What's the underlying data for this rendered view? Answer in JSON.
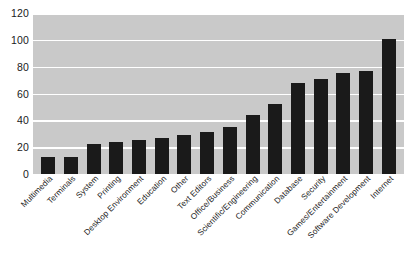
{
  "chart_data": {
    "type": "bar",
    "title": "",
    "subtitle": "",
    "xlabel": "",
    "ylabel": "",
    "ylim": [
      0,
      120
    ],
    "ytick_step": 20,
    "yticks": [
      "120",
      "100",
      "80",
      "60",
      "40",
      "20",
      "0"
    ],
    "grid": true,
    "grid_axis": "y",
    "legend": false,
    "legend_position": "none",
    "bar_color": "#1a1a1a",
    "plot_background": "#c9c9c9",
    "gridline_color": "#ffffff",
    "page_background": "#ffffff",
    "xtick_rotation": -45,
    "categories": [
      "Multimedia",
      "Terminals",
      "System",
      "Printing",
      "Desktop Environment",
      "Education",
      "Other",
      "Text Editors",
      "Office/Business",
      "Scientific/Engineering",
      "Communication",
      "Database",
      "Security",
      "Games/Entertainment",
      "Software Development",
      "Internet"
    ],
    "values": [
      13,
      13,
      22,
      24,
      25,
      27,
      29,
      31,
      35,
      44,
      52,
      68,
      71,
      75,
      77,
      101
    ]
  }
}
